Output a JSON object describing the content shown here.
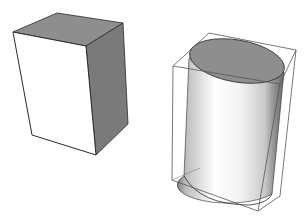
{
  "figure": {
    "shapes": [
      {
        "name": "rectangular-box",
        "style": "solid-shaded"
      },
      {
        "name": "cylinder-in-bounding-box",
        "style": "shaded-with-wireframe"
      }
    ]
  },
  "colors": {
    "background": "#ffffff",
    "front_face": "#ffffff",
    "top_face": "#8e8e8e",
    "side_face": "#7a7a7a",
    "edge": "#2a2a2a",
    "wire": "#555555"
  }
}
